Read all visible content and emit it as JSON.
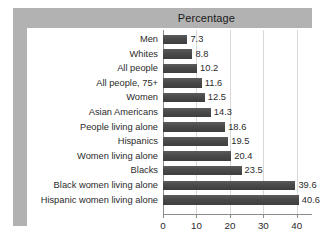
{
  "title": "Percentage",
  "chart_data": {
    "type": "bar",
    "orientation": "horizontal",
    "title": "Percentage",
    "xlabel": "",
    "ylabel": "",
    "xlim": [
      0,
      43
    ],
    "grid": true,
    "legend": false,
    "xticks": [
      0,
      10,
      20,
      30,
      40
    ],
    "xtick_labels": [
      "0",
      "10",
      "20",
      "30",
      "40"
    ],
    "categories": [
      "Men",
      "Whites",
      "All people",
      "All people, 75+",
      "Women",
      "Asian Americans",
      "People living alone",
      "Hispanics",
      "Women living alone",
      "Blacks",
      "Black women living alone",
      "Hispanic women living alone"
    ],
    "values": [
      7.3,
      8.8,
      10.2,
      11.6,
      12.5,
      14.3,
      18.6,
      19.5,
      20.4,
      23.5,
      39.6,
      40.6
    ],
    "value_labels": [
      "7.3",
      "8.8",
      "10.2",
      "11.6",
      "12.5",
      "14.3",
      "18.6",
      "19.5",
      "20.4",
      "23.5",
      "39.6",
      "40.6"
    ]
  },
  "colors": {
    "bar": "#4a4a4a",
    "frame": "#b2b2b2",
    "gridline": "#d9d9d9",
    "axis": "#8c8c8c",
    "text": "#2b2b2b",
    "background": "#ffffff"
  }
}
